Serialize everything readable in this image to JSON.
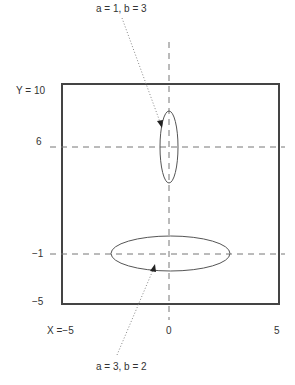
{
  "diagram": {
    "colors": {
      "frame": "#444444",
      "ellipse": "#555555",
      "dash": "#777777",
      "text": "#333333"
    },
    "annotations": {
      "top": "a = 1,  b = 3",
      "bottom": "a = 3,  b = 2"
    },
    "y_labels": {
      "y10": "Y = 10",
      "y6": "6",
      "ym1": "−1",
      "ym5": "−5"
    },
    "x_labels": {
      "xm5": "X =−5",
      "x0": "0",
      "x5": "5"
    },
    "ellipses": [
      {
        "name": "vertical-ellipse",
        "cx": 0,
        "cy": 6,
        "a": 1,
        "b": 3
      },
      {
        "name": "horizontal-ellipse",
        "cx": 0,
        "cy": -1,
        "a": 3,
        "b": 2
      }
    ],
    "frame": {
      "xmin": -5,
      "xmax": 5,
      "ymin": -5,
      "ymax": 10
    }
  }
}
